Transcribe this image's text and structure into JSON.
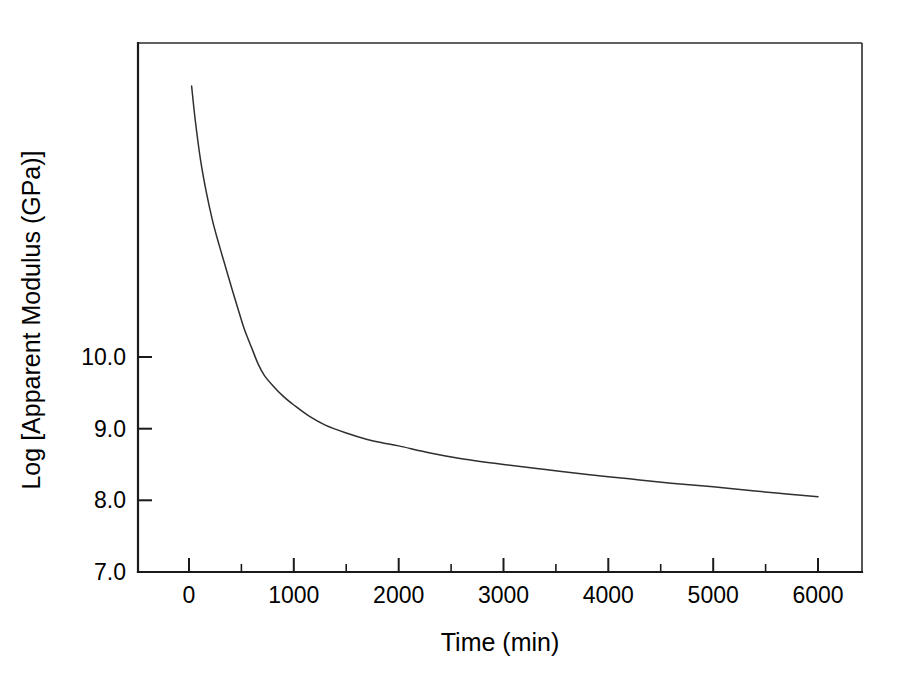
{
  "chart_data": {
    "type": "line",
    "title": "",
    "subtitle": "",
    "xlabel": "Time (min)",
    "ylabel": "Log [Apparent Modulus (GPa)]",
    "xlim": [
      -500,
      6500
    ],
    "ylim": [
      7.0,
      14.4
    ],
    "grid": false,
    "legend": null,
    "x_ticks_major": [
      0,
      1000,
      2000,
      3000,
      4000,
      5000,
      6000
    ],
    "x_tick_labels": [
      "0",
      "1000",
      "2000",
      "3000",
      "4000",
      "5000",
      "6000"
    ],
    "x_ticks_minor": [
      500,
      1500,
      2500,
      3500,
      4500,
      5500
    ],
    "y_ticks_major": [
      7.0,
      8.0,
      9.0,
      10.0
    ],
    "y_tick_labels": [
      "7.0",
      "8.0",
      "9.0",
      "10.0"
    ],
    "y_ticks_minor": [],
    "series": [
      {
        "name": "Apparent modulus relaxation",
        "color": "#2f2f2f",
        "x": [
          25,
          60,
          110,
          165,
          225,
          290,
          350,
          410,
          470,
          530,
          600,
          660,
          720,
          800,
          900,
          1000,
          1150,
          1300,
          1500,
          1700,
          1850,
          2000,
          2300,
          2600,
          3000,
          3400,
          3800,
          4200,
          4600,
          5000,
          5400,
          5700,
          6000
        ],
        "y": [
          13.78,
          13.3,
          12.75,
          12.3,
          11.9,
          11.55,
          11.25,
          10.95,
          10.66,
          10.38,
          10.12,
          9.9,
          9.74,
          9.6,
          9.45,
          9.33,
          9.17,
          9.05,
          8.94,
          8.85,
          8.8,
          8.76,
          8.66,
          8.58,
          8.5,
          8.43,
          8.36,
          8.3,
          8.24,
          8.19,
          8.13,
          8.09,
          8.05
        ]
      }
    ],
    "annotations": []
  },
  "figure": {
    "background_color": "#ffffff",
    "axis_color": "#1a1a1a",
    "curve_color": "#2f2f2f"
  },
  "axes": {
    "x_title": "Time (min)",
    "y_title": "Log [Apparent Modulus (GPa)]"
  }
}
